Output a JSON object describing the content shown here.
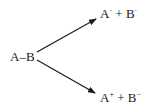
{
  "diagram": {
    "reactant": "A–B",
    "homolytic": {
      "a": "A",
      "a_sup": "·",
      "plus": "+",
      "b": "B",
      "b_sup": "·"
    },
    "heterolytic": {
      "a": "A",
      "a_sup": "+",
      "plus": "+",
      "b": "B",
      "b_sup": "−"
    },
    "colors": {
      "ink": "#1a1a1a",
      "background": "#ffffff"
    }
  }
}
